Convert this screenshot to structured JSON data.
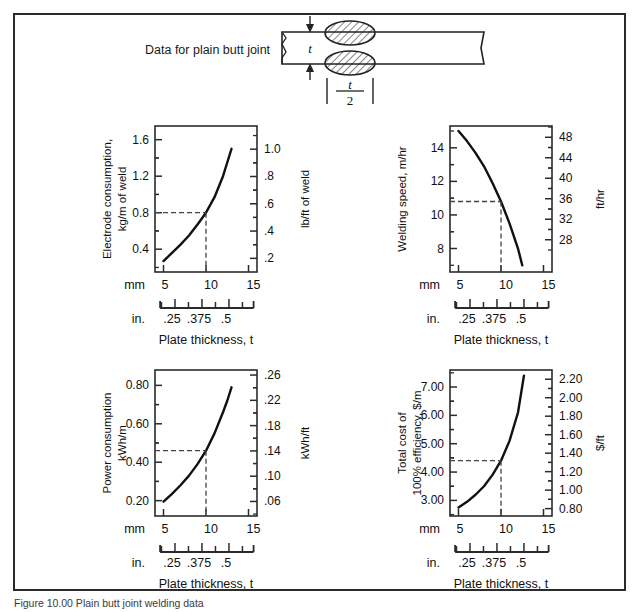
{
  "figure": {
    "header_left": "Data for plain butt joint",
    "header_right": "Flat position",
    "weld_thickness_symbol": "t",
    "weld_halfwidth_numer": "t",
    "weld_halfwidth_denom": "2",
    "caption": "Figure 10.00  Plain butt joint welding data",
    "xaxis_label": "Plate thickness, t",
    "mm_tag": "mm",
    "in_tag": "in.",
    "mm_ticks": [
      "5",
      "10",
      "15"
    ],
    "in_ticks": [
      ".25",
      ".375",
      ".5"
    ],
    "border_color": "#2b2b2b",
    "curve_color": "#111111",
    "guide_color": "#444444"
  },
  "chart_data": [
    {
      "type": "line",
      "id": "electrode-consumption",
      "title": "",
      "ylabel": "Electrode consumption,\nkg/m of weld",
      "ylabel_line1": "Electrode consumption,",
      "ylabel_line2": "kg/m of weld",
      "y2label": "lb/ft of weld",
      "xlabel": "Plate thickness, t",
      "xlim": [
        4,
        16
      ],
      "ylim": [
        0.15,
        1.75
      ],
      "y2lim": [
        0.1,
        1.17
      ],
      "yticks": [
        "0.4",
        "0.8",
        "1.2",
        "1.6"
      ],
      "ytick_values": [
        0.4,
        0.8,
        1.2,
        1.6
      ],
      "y2ticks": [
        ".2",
        ".4",
        ".6",
        ".8",
        "1.0"
      ],
      "y2tick_values": [
        0.2,
        0.4,
        0.6,
        0.8,
        1.0
      ],
      "xticks": [
        "5",
        "10",
        "15"
      ],
      "xtick_values": [
        5,
        10,
        15
      ],
      "grid": false,
      "x": [
        5,
        6,
        7,
        8,
        9,
        10,
        11,
        12,
        12.5,
        13
      ],
      "values": [
        0.27,
        0.36,
        0.45,
        0.55,
        0.67,
        0.8,
        0.97,
        1.2,
        1.35,
        1.5
      ],
      "guide": {
        "x": 10,
        "y": 0.8,
        "label_x": "10",
        "label_y": "0.8"
      }
    },
    {
      "type": "line",
      "id": "welding-speed",
      "title": "",
      "ylabel": "Welding speed, m/hr",
      "ylabel_line1": "Welding speed, m/hr",
      "ylabel_line2": "",
      "y2label": "ft/hr",
      "xlabel": "Plate thickness, t",
      "xlim": [
        4,
        16
      ],
      "ylim": [
        6.6,
        15.3
      ],
      "y2lim": [
        21.7,
        50.2
      ],
      "yticks": [
        "8",
        "10",
        "12",
        "14"
      ],
      "ytick_values": [
        8,
        10,
        12,
        14
      ],
      "y2ticks": [
        "28",
        "32",
        "36",
        "40",
        "44",
        "48"
      ],
      "y2tick_values": [
        28,
        32,
        36,
        40,
        44,
        48
      ],
      "xticks": [
        "5",
        "10",
        "15"
      ],
      "xtick_values": [
        5,
        10,
        15
      ],
      "grid": false,
      "x": [
        5,
        6,
        7,
        8,
        9,
        10,
        11,
        12,
        12.5
      ],
      "values": [
        15.0,
        14.4,
        13.7,
        12.9,
        11.9,
        10.8,
        9.5,
        8.0,
        7.0
      ],
      "guide": {
        "x": 10,
        "y": 10.8,
        "label_x": "10",
        "label_y": "10.8"
      }
    },
    {
      "type": "line",
      "id": "power-consumption",
      "title": "",
      "ylabel": "Power consumption\nkWh/m",
      "ylabel_line1": "Power consumption",
      "ylabel_line2": "kWh/m",
      "y2label": "kWh/ft",
      "xlabel": "Plate thickness, t",
      "xlim": [
        4,
        16
      ],
      "ylim": [
        0.12,
        0.88
      ],
      "y2lim": [
        0.037,
        0.268
      ],
      "yticks": [
        "0.20",
        "0.40",
        "0.60",
        "0.80"
      ],
      "ytick_values": [
        0.2,
        0.4,
        0.6,
        0.8
      ],
      "y2ticks": [
        ".06",
        ".10",
        ".14",
        ".18",
        ".22",
        ".26"
      ],
      "y2tick_values": [
        0.06,
        0.1,
        0.14,
        0.18,
        0.22,
        0.26
      ],
      "xticks": [
        "5",
        "10",
        "15"
      ],
      "xtick_values": [
        5,
        10,
        15
      ],
      "grid": false,
      "x": [
        5,
        6,
        7,
        8,
        9,
        10,
        11,
        12,
        12.5,
        13
      ],
      "values": [
        0.195,
        0.235,
        0.28,
        0.33,
        0.39,
        0.46,
        0.55,
        0.66,
        0.72,
        0.79
      ],
      "guide": {
        "x": 10,
        "y": 0.46,
        "label_x": "10",
        "label_y": "0.46"
      }
    },
    {
      "type": "line",
      "id": "total-cost",
      "title": "",
      "ylabel": "Total cost of\n100% efficiency, $/m",
      "ylabel_line1": "Total cost of",
      "ylabel_line2": "100% efficiency, $/m",
      "y2label": "$/ft",
      "xlabel": "Plate thickness, t",
      "xlim": [
        4,
        16
      ],
      "ylim": [
        2.45,
        7.6
      ],
      "y2lim": [
        0.72,
        2.3
      ],
      "yticks": [
        "3.00",
        "4.00",
        "5.00",
        "6.00",
        "7.00"
      ],
      "ytick_values": [
        3.0,
        4.0,
        5.0,
        6.0,
        7.0
      ],
      "y2ticks": [
        "0.80",
        "1.00",
        "1.20",
        "1.40",
        "1.60",
        "1.80",
        "2.00",
        "2.20"
      ],
      "y2tick_values": [
        0.8,
        1.0,
        1.2,
        1.4,
        1.6,
        1.8,
        2.0,
        2.2
      ],
      "xticks": [
        "5",
        "10",
        "15"
      ],
      "xtick_values": [
        5,
        10,
        15
      ],
      "grid": false,
      "x": [
        5,
        6,
        7,
        8,
        9,
        10,
        11,
        12,
        12.7
      ],
      "values": [
        2.75,
        2.95,
        3.2,
        3.5,
        3.9,
        4.4,
        5.1,
        6.1,
        7.4
      ],
      "guide": {
        "x": 10,
        "y": 4.4,
        "label_x": "10",
        "label_y": "4.40"
      }
    }
  ]
}
